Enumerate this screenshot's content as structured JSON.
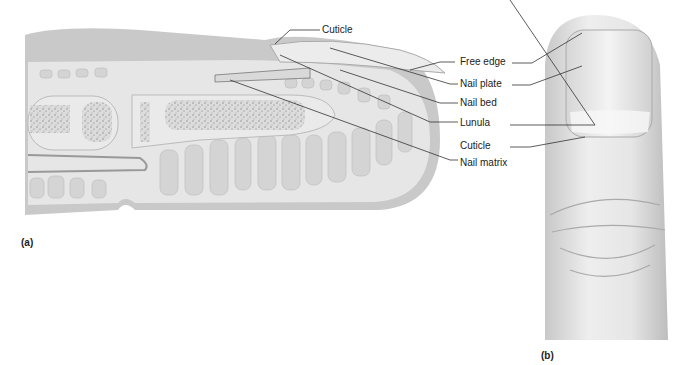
{
  "figure": {
    "panel_a": {
      "tag": "(a)",
      "title": "Sagittal section of fingertip",
      "labels": {
        "cuticle": "Cuticle",
        "free_edge": "Free edge",
        "nail_plate": "Nail plate",
        "nail_bed": "Nail bed",
        "lunula": "Lunula",
        "nail_matrix": "Nail matrix"
      }
    },
    "panel_b": {
      "tag": "(b)",
      "title": "Dorsal view of fingertip",
      "labels": {
        "cuticle": "Cuticle"
      }
    },
    "colors": {
      "skin_outer": "#c9c9c9",
      "dermis": "#e4e4e4",
      "fat_lobules": "#d2d2d2",
      "bone": "#e9e9e9",
      "bone_marrow": "#9a9a9a",
      "nail": "#ededed",
      "leader_line": "#333333"
    }
  }
}
